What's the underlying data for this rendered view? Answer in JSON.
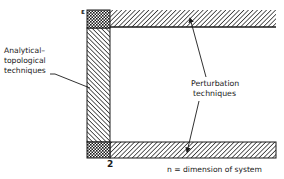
{
  "diagram": {
    "type": "region-diagram",
    "axes": {
      "vertical_label": "ε",
      "horizontal_tick": "2",
      "horizontal_caption": "n = dimension of system"
    },
    "regions": [
      {
        "name": "analytical-topological",
        "pattern": "diagonal-hatch-backslash",
        "location": "vertical strip at n = 2"
      },
      {
        "name": "perturbation-top",
        "pattern": "diagonal-hatch-slash",
        "location": "top horizontal strip (large ε)"
      },
      {
        "name": "perturbation-bottom",
        "pattern": "diagonal-hatch-slash",
        "location": "bottom horizontal strip (small ε)"
      },
      {
        "name": "overlap-top",
        "pattern": "crosshatch",
        "location": "top-left corner"
      },
      {
        "name": "overlap-bottom",
        "pattern": "crosshatch",
        "location": "bottom-left corner"
      }
    ],
    "labels": {
      "analytical": [
        "Analytical–",
        "topological",
        "techniques"
      ],
      "perturbation": [
        "Perturbation",
        "techniques"
      ]
    },
    "colors": {
      "ink": "#1a1a1a",
      "background": "#ffffff"
    }
  }
}
